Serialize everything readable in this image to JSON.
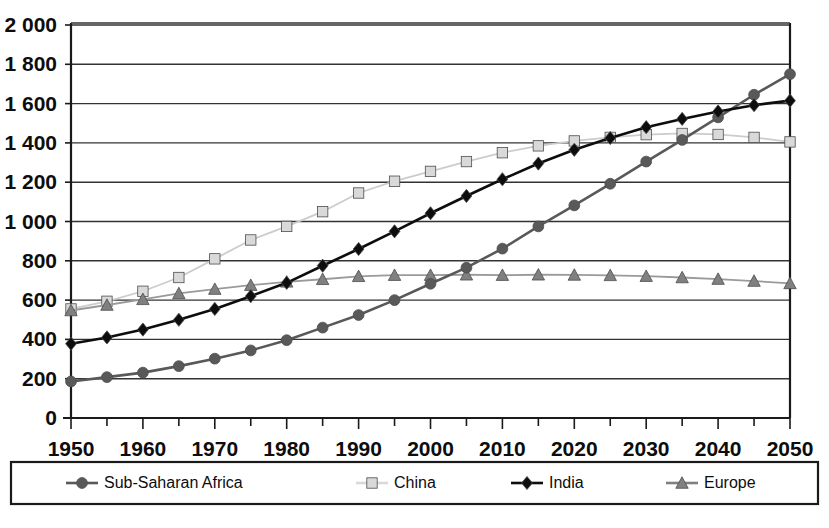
{
  "chart_data": {
    "type": "line",
    "title": "",
    "subtitle": "",
    "xlabel": "",
    "ylabel": "",
    "xlim": [
      1950,
      2050
    ],
    "ylim": [
      0,
      2000
    ],
    "grid": true,
    "legend_position": "bottom",
    "x": [
      1950,
      1955,
      1960,
      1965,
      1970,
      1975,
      1980,
      1985,
      1990,
      1995,
      2000,
      2005,
      2010,
      2015,
      2020,
      2025,
      2030,
      2035,
      2040,
      2045,
      2050
    ],
    "xticks": [
      "1950",
      "1960",
      "1970",
      "1980",
      "1990",
      "2000",
      "2010",
      "2020",
      "2030",
      "2040",
      "2050"
    ],
    "xtick_values": [
      1950,
      1960,
      1970,
      1980,
      1990,
      2000,
      2010,
      2020,
      2030,
      2040,
      2050
    ],
    "xminor_values": [
      1955,
      1965,
      1975,
      1985,
      1995,
      2005,
      2015,
      2025,
      2035,
      2045
    ],
    "yticks": [
      "0",
      "200",
      "400",
      "600",
      "800",
      "1 000",
      "1 200",
      "1 400",
      "1 600",
      "1 800",
      "2 000"
    ],
    "ytick_values": [
      0,
      200,
      400,
      600,
      800,
      1000,
      1200,
      1400,
      1600,
      1800,
      2000
    ],
    "series": [
      {
        "name": "Sub-Saharan Africa",
        "marker": "circle",
        "color": "#595959",
        "line_color": "#595959",
        "values": [
          186,
          208,
          231,
          264,
          302,
          344,
          396,
          460,
          524,
          600,
          683,
          765,
          862,
          975,
          1082,
          1192,
          1305,
          1415,
          1530,
          1645,
          1750
        ]
      },
      {
        "name": "China",
        "marker": "square",
        "color": "#d9d9d9",
        "line_color": "#cccccc",
        "values": [
          555,
          594,
          645,
          715,
          810,
          906,
          975,
          1050,
          1145,
          1205,
          1255,
          1305,
          1350,
          1385,
          1410,
          1428,
          1442,
          1448,
          1443,
          1428,
          1405
        ]
      },
      {
        "name": "India",
        "marker": "diamond",
        "color": "#0d0d0d",
        "line_color": "#0d0d0d",
        "values": [
          378,
          410,
          450,
          500,
          555,
          620,
          688,
          775,
          860,
          950,
          1042,
          1130,
          1215,
          1295,
          1365,
          1425,
          1480,
          1522,
          1560,
          1592,
          1615
        ]
      },
      {
        "name": "Europe",
        "marker": "triangle",
        "color": "#808080",
        "line_color": "#9a9a9a",
        "values": [
          547,
          575,
          604,
          634,
          656,
          676,
          693,
          706,
          721,
          727,
          727,
          729,
          727,
          729,
          728,
          726,
          722,
          715,
          707,
          697,
          685
        ]
      }
    ]
  },
  "legend": {
    "items": [
      {
        "label": "Sub-Saharan Africa",
        "marker": "circle",
        "color": "#595959"
      },
      {
        "label": "China",
        "marker": "square",
        "color": "#d9d9d9"
      },
      {
        "label": "India",
        "marker": "diamond",
        "color": "#0d0d0d"
      },
      {
        "label": "Europe",
        "marker": "triangle",
        "color": "#808080"
      }
    ]
  }
}
